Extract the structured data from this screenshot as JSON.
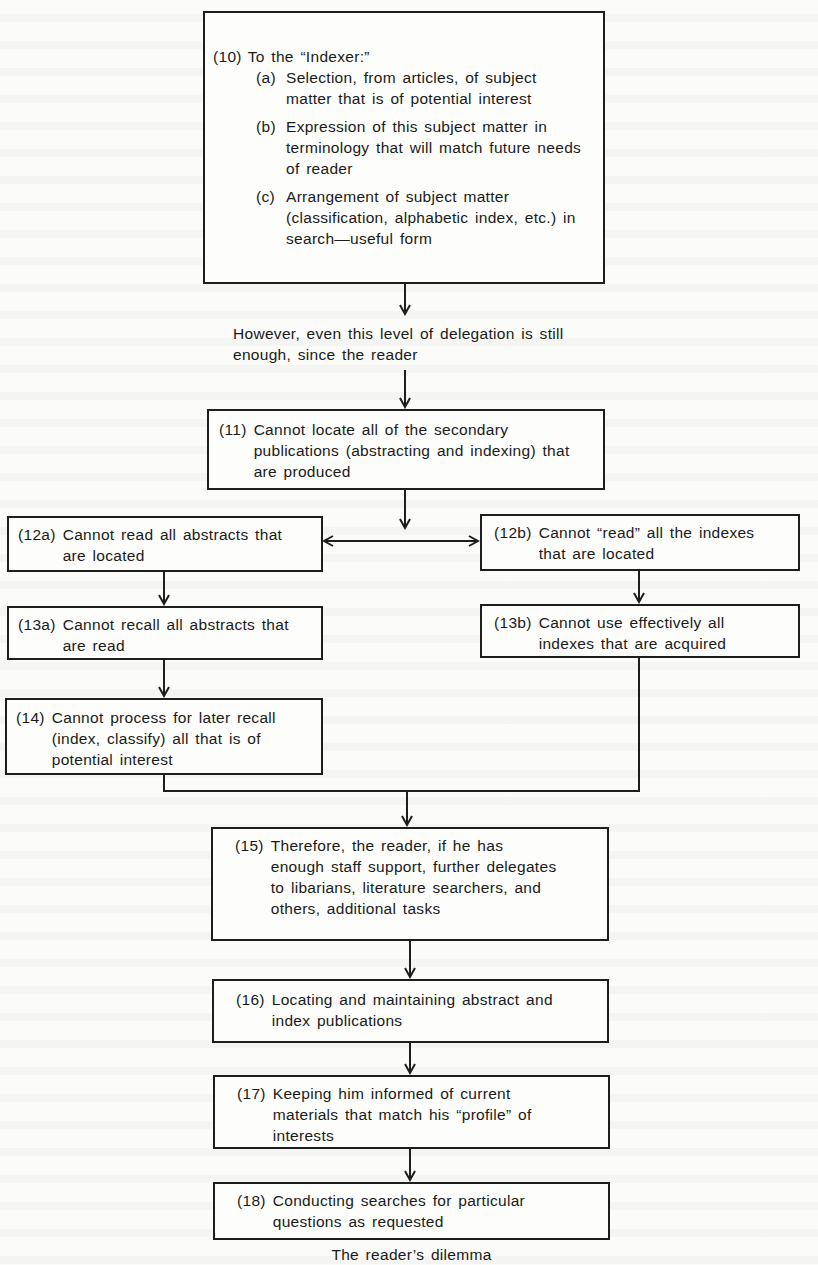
{
  "diagram": {
    "caption": "The reader’s dilemma",
    "bridge_text": "However, even this level of delegation is still enough, since the reader",
    "nodes": {
      "n10": {
        "num": "(10)",
        "text": "To the “Indexer:”",
        "subitems": [
          {
            "label": "(a)",
            "text": "Selection, from articles, of subject matter that is of potential interest"
          },
          {
            "label": "(b)",
            "text": "Expression of this subject matter in terminology that will match future needs of reader"
          },
          {
            "label": "(c)",
            "text": "Arrangement of subject matter (classification, alphabetic index, etc.) in search—useful form"
          }
        ]
      },
      "n11": {
        "num": "(11)",
        "text": "Cannot locate all of the secondary publications (abstracting and indexing) that are produced"
      },
      "n12a": {
        "num": "(12a)",
        "text": "Cannot read all abstracts that are located"
      },
      "n12b": {
        "num": "(12b)",
        "text": "Cannot “read” all the indexes that are located"
      },
      "n13a": {
        "num": "(13a)",
        "text": "Cannot recall all abstracts that are read"
      },
      "n13b": {
        "num": "(13b)",
        "text": "Cannot use effectively all indexes that are acquired"
      },
      "n14": {
        "num": "(14)",
        "text": "Cannot process for later recall (index, classify) all that is of potential interest"
      },
      "n15": {
        "num": "(15)",
        "text": "Therefore, the reader, if he has enough staff support, further delegates to libarians, literature searchers, and others, additional tasks"
      },
      "n16": {
        "num": "(16)",
        "text": "Locating and maintaining abstract and index publications"
      },
      "n17": {
        "num": "(17)",
        "text": "Keeping him informed of current materials that match his “profile” of interests"
      },
      "n18": {
        "num": "(18)",
        "text": "Conducting searches for particular questions as requested"
      }
    },
    "edges": [
      [
        "n10",
        "bridge_text"
      ],
      [
        "bridge_text",
        "n11"
      ],
      [
        "n11",
        "n12a"
      ],
      [
        "n11",
        "n12b"
      ],
      [
        "n12a",
        "n13a"
      ],
      [
        "n12b",
        "n13b"
      ],
      [
        "n13a",
        "n14"
      ],
      [
        "n14",
        "n15"
      ],
      [
        "n13b",
        "n15"
      ],
      [
        "n15",
        "n16"
      ],
      [
        "n16",
        "n17"
      ],
      [
        "n17",
        "n18"
      ]
    ],
    "colors": {
      "line": "#1e1e1e",
      "paper": "#fbfbf9"
    }
  }
}
